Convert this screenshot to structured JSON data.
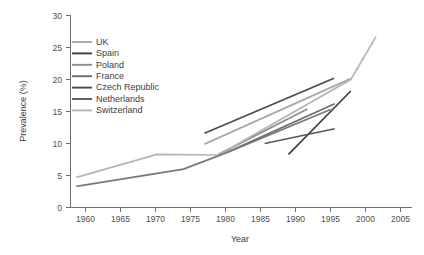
{
  "chart_data": {
    "type": "line",
    "title": "",
    "xlabel": "Year",
    "ylabel": "Prevalence (%)",
    "xlim": [
      1957,
      2006
    ],
    "ylim": [
      0,
      30
    ],
    "xticks": [
      1960,
      1965,
      1970,
      1975,
      1980,
      1985,
      1990,
      1995,
      2000,
      2005
    ],
    "yticks": [
      0,
      5,
      10,
      15,
      20,
      25,
      30
    ],
    "grid": false,
    "legend_position": "top-left",
    "series": [
      {
        "name": "UK",
        "color": "#a8a8a8",
        "x": [
          1977.0,
          1997.8
        ],
        "values": [
          9.9,
          20.1
        ]
      },
      {
        "name": "Spain",
        "color": "#3f3f3f",
        "x": [
          1989.0,
          1997.9
        ],
        "values": [
          8.3,
          18.2
        ]
      },
      {
        "name": "Poland",
        "color": "#8d8d8d",
        "x": [
          1979.0,
          1991.7
        ],
        "values": [
          8.3,
          15.4
        ]
      },
      {
        "name": "France",
        "color": "#6b6b6b",
        "x": [
          1980.0,
          1995.6
        ],
        "values": [
          8.5,
          16.2
        ]
      },
      {
        "name": "Czech Republic",
        "color": "#4a4a4a",
        "x": [
          1977.0,
          1995.5
        ],
        "values": [
          11.6,
          20.2
        ]
      },
      {
        "name": "Netherlands",
        "color": "#585858",
        "x": [
          1985.6,
          1995.6
        ],
        "values": [
          10.0,
          12.3
        ]
      },
      {
        "name": "Switzerland",
        "color": "#b4b4b4",
        "x": [
          1958.7,
          1970.2,
          1979.0,
          1997.9,
          2001.5
        ],
        "values": [
          4.7,
          8.3,
          8.2,
          20.0,
          26.7
        ]
      },
      {
        "name": "long-dark-trend",
        "color": "#787878",
        "x": [
          1958.7,
          1974.0,
          1980.0,
          1995.0
        ],
        "values": [
          3.3,
          6.0,
          8.5,
          15.3
        ]
      }
    ],
    "legend_entries": [
      "UK",
      "Spain",
      "Poland",
      "France",
      "Czech Republic",
      "Netherlands",
      "Switzerland"
    ]
  }
}
